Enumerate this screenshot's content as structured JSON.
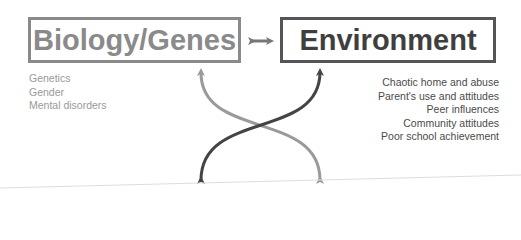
{
  "diagram": {
    "left_box": {
      "label": "Biology/Genes",
      "color": "#8a8a8a"
    },
    "right_box": {
      "label": "Environment",
      "color": "#3f3f3f"
    },
    "connector": {
      "type": "double-arrow",
      "symbol": "↔"
    },
    "left_factors": [
      "Genetics",
      "Gender",
      "Mental disorders"
    ],
    "right_factors": [
      "Chaotic home and abuse",
      "Parent's use and attitudes",
      "Peer influences",
      "Community attitudes",
      "Poor school achievement"
    ],
    "arrows": [
      {
        "name": "light-arrow",
        "color": "#9a9a9a",
        "from": "bottom-right",
        "to": "Biology/Genes"
      },
      {
        "name": "dark-arrow",
        "color": "#444444",
        "from": "bottom-left",
        "to": "Environment"
      }
    ]
  }
}
